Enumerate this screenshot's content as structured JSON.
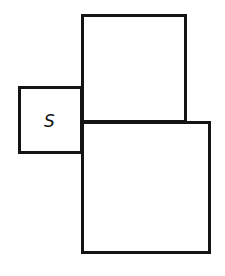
{
  "diagram": {
    "shapes": [
      {
        "id": "small-square",
        "label": "S",
        "x": 18,
        "y": 86,
        "w": 65,
        "h": 68
      },
      {
        "id": "top-square",
        "label": "",
        "x": 81,
        "y": 14,
        "w": 106,
        "h": 109
      },
      {
        "id": "bottom-square",
        "label": "",
        "x": 81,
        "y": 121,
        "w": 130,
        "h": 133
      }
    ],
    "stroke_color": "#141414",
    "background": "#ffffff"
  }
}
